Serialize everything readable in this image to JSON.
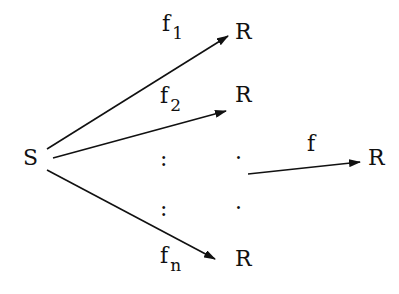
{
  "diagram": {
    "source": {
      "label": "S"
    },
    "targets": [
      {
        "label": "R",
        "map": "f",
        "sub": "1"
      },
      {
        "label": "R",
        "map": "f",
        "sub": "2"
      },
      {
        "label": "R",
        "map": "f",
        "sub": "n"
      }
    ],
    "ellipsis": {
      "vertical": ":",
      "dot": "·"
    },
    "composite": {
      "map": "f",
      "target": "R"
    },
    "stroke_color": "#111111"
  }
}
